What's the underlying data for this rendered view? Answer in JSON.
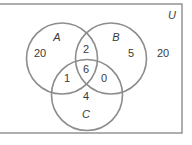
{
  "universe": {
    "label": "U",
    "outside_count": "20"
  },
  "sets": {
    "A": {
      "label": "A",
      "only_count": "20"
    },
    "B": {
      "label": "B",
      "only_count": "5"
    },
    "C": {
      "label": "C",
      "only_count": "4"
    }
  },
  "intersections": {
    "AB_only": "2",
    "AC_only": "1",
    "BC_only": "0",
    "ABC": "6"
  },
  "colors": {
    "stroke": "#8c8c8c",
    "text": "#3a3a3a",
    "background": "#ffffff"
  }
}
